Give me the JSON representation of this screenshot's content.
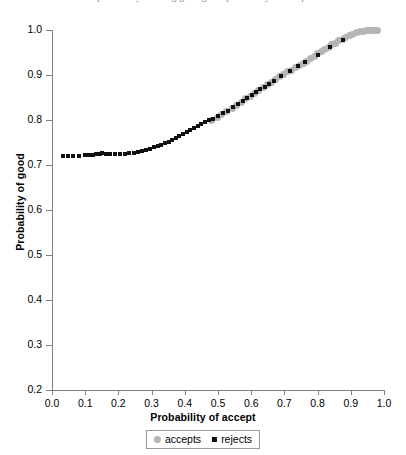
{
  "top_caption": "probability of being good given probability of accept",
  "chart_data": {
    "type": "scatter",
    "title": "",
    "xlabel": "Probability of accept",
    "ylabel": "Probability of good",
    "xlim": [
      0.0,
      1.0
    ],
    "ylim": [
      0.2,
      1.0
    ],
    "xticks": [
      "0.0",
      "0.1",
      "0.2",
      "0.3",
      "0.4",
      "0.5",
      "0.6",
      "0.7",
      "0.8",
      "0.9",
      "1.0"
    ],
    "xtick_values": [
      0.0,
      0.1,
      0.2,
      0.3,
      0.4,
      0.5,
      0.6,
      0.7,
      0.8,
      0.9,
      1.0
    ],
    "yticks": [
      "0.2",
      "0.3",
      "0.4",
      "0.5",
      "0.6",
      "0.7",
      "0.8",
      "0.9",
      "1.0"
    ],
    "ytick_values": [
      0.2,
      0.3,
      0.4,
      0.5,
      0.6,
      0.7,
      0.8,
      0.9,
      1.0
    ],
    "grid": false,
    "legend_position": "bottom-center",
    "series": [
      {
        "name": "accepts",
        "marker": "circle",
        "color": "#b5b5b5",
        "points": [
          [
            0.48,
            0.8
          ],
          [
            0.497,
            0.806
          ],
          [
            0.512,
            0.812
          ],
          [
            0.527,
            0.818
          ],
          [
            0.543,
            0.826
          ],
          [
            0.556,
            0.833
          ],
          [
            0.57,
            0.84
          ],
          [
            0.583,
            0.847
          ],
          [
            0.597,
            0.853
          ],
          [
            0.61,
            0.86
          ],
          [
            0.622,
            0.866
          ],
          [
            0.636,
            0.873
          ],
          [
            0.649,
            0.878
          ],
          [
            0.66,
            0.884
          ],
          [
            0.673,
            0.889
          ],
          [
            0.686,
            0.896
          ],
          [
            0.698,
            0.901
          ],
          [
            0.71,
            0.907
          ],
          [
            0.722,
            0.911
          ],
          [
            0.733,
            0.916
          ],
          [
            0.745,
            0.921
          ],
          [
            0.757,
            0.926
          ],
          [
            0.768,
            0.931
          ],
          [
            0.779,
            0.936
          ],
          [
            0.79,
            0.941
          ],
          [
            0.801,
            0.947
          ],
          [
            0.812,
            0.952
          ],
          [
            0.822,
            0.957
          ],
          [
            0.833,
            0.962
          ],
          [
            0.843,
            0.967
          ],
          [
            0.853,
            0.971
          ],
          [
            0.864,
            0.976
          ],
          [
            0.874,
            0.98
          ],
          [
            0.884,
            0.984
          ],
          [
            0.895,
            0.988
          ],
          [
            0.906,
            0.991
          ],
          [
            0.917,
            0.994
          ],
          [
            0.928,
            0.996
          ],
          [
            0.938,
            0.997
          ],
          [
            0.948,
            0.998
          ],
          [
            0.957,
            0.999
          ],
          [
            0.965,
            0.999
          ],
          [
            0.972,
            1.0
          ],
          [
            0.979,
            1.0
          ]
        ]
      },
      {
        "name": "rejects",
        "marker": "square",
        "color": "#101010",
        "points": [
          [
            0.032,
            0.72
          ],
          [
            0.048,
            0.72
          ],
          [
            0.062,
            0.721
          ],
          [
            0.08,
            0.721
          ],
          [
            0.098,
            0.722
          ],
          [
            0.112,
            0.722
          ],
          [
            0.124,
            0.723
          ],
          [
            0.134,
            0.724
          ],
          [
            0.144,
            0.725
          ],
          [
            0.152,
            0.726
          ],
          [
            0.163,
            0.725
          ],
          [
            0.176,
            0.724
          ],
          [
            0.19,
            0.724
          ],
          [
            0.205,
            0.724
          ],
          [
            0.22,
            0.725
          ],
          [
            0.233,
            0.726
          ],
          [
            0.247,
            0.727
          ],
          [
            0.26,
            0.729
          ],
          [
            0.272,
            0.731
          ],
          [
            0.284,
            0.733
          ],
          [
            0.296,
            0.736
          ],
          [
            0.307,
            0.739
          ],
          [
            0.318,
            0.742
          ],
          [
            0.329,
            0.745
          ],
          [
            0.34,
            0.749
          ],
          [
            0.351,
            0.752
          ],
          [
            0.362,
            0.756
          ],
          [
            0.373,
            0.76
          ],
          [
            0.384,
            0.765
          ],
          [
            0.395,
            0.769
          ],
          [
            0.406,
            0.773
          ],
          [
            0.417,
            0.778
          ],
          [
            0.428,
            0.782
          ],
          [
            0.439,
            0.787
          ],
          [
            0.45,
            0.791
          ],
          [
            0.461,
            0.795
          ],
          [
            0.472,
            0.799
          ],
          [
            0.485,
            0.803
          ],
          [
            0.499,
            0.809
          ],
          [
            0.514,
            0.815
          ],
          [
            0.53,
            0.821
          ],
          [
            0.546,
            0.828
          ],
          [
            0.56,
            0.836
          ],
          [
            0.574,
            0.842
          ],
          [
            0.588,
            0.849
          ],
          [
            0.601,
            0.855
          ],
          [
            0.615,
            0.862
          ],
          [
            0.628,
            0.868
          ],
          [
            0.641,
            0.874
          ],
          [
            0.655,
            0.88
          ],
          [
            0.668,
            0.886
          ],
          [
            0.69,
            0.897
          ],
          [
            0.716,
            0.908
          ],
          [
            0.742,
            0.919
          ],
          [
            0.762,
            0.928
          ],
          [
            0.8,
            0.944
          ],
          [
            0.838,
            0.962
          ],
          [
            0.876,
            0.978
          ]
        ]
      }
    ]
  },
  "legend": {
    "entries": [
      {
        "label": "accepts",
        "marker": "circle",
        "color": "#b5b5b5"
      },
      {
        "label": "rejects",
        "marker": "square",
        "color": "#101010"
      }
    ]
  }
}
